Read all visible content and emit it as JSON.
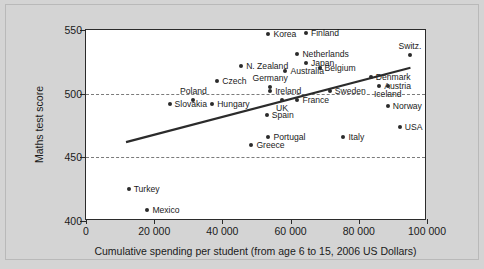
{
  "chart_data": {
    "type": "scatter",
    "title": "",
    "xlabel": "Cumulative spending per student (from age 6 to 15, 2006 US Dollars)",
    "ylabel": "Maths test score",
    "xlim": [
      0,
      100000
    ],
    "ylim": [
      400,
      550
    ],
    "xticks": [
      0,
      20000,
      40000,
      60000,
      80000,
      100000
    ],
    "xtick_labels": [
      "0",
      "20 000",
      "40 000",
      "60 000",
      "80 000",
      "100 000"
    ],
    "yticks": [
      400,
      450,
      500,
      550
    ],
    "ytick_labels": [
      "400",
      "450",
      "500",
      "550"
    ],
    "gridlines_y": [
      450,
      500
    ],
    "grid": "dashed horizontal gridlines at 450 and 500",
    "legend": "none",
    "points": [
      {
        "label": "Korea",
        "x": 53500,
        "y": 547,
        "pos": "right"
      },
      {
        "label": "Finland",
        "x": 64500,
        "y": 548,
        "pos": "right"
      },
      {
        "label": "Switz.",
        "x": 95000,
        "y": 530,
        "pos": "above"
      },
      {
        "label": "Netherlands",
        "x": 62000,
        "y": 531,
        "pos": "right"
      },
      {
        "label": "Japan",
        "x": 64500,
        "y": 524,
        "pos": "right"
      },
      {
        "label": "Belgium",
        "x": 68500,
        "y": 520,
        "pos": "right"
      },
      {
        "label": "Australia",
        "x": 58500,
        "y": 518,
        "pos": "right"
      },
      {
        "label": "N. Zealand",
        "x": 45500,
        "y": 522,
        "pos": "right"
      },
      {
        "label": "Czech",
        "x": 38500,
        "y": 510,
        "pos": "right"
      },
      {
        "label": "Denmark",
        "x": 83500,
        "y": 513,
        "pos": "right"
      },
      {
        "label": "Germany",
        "x": 54000,
        "y": 505,
        "pos": "above"
      },
      {
        "label": "Austria",
        "x": 86000,
        "y": 506,
        "pos": "right"
      },
      {
        "label": "Ireland",
        "x": 54000,
        "y": 502,
        "pos": "right"
      },
      {
        "label": "Sweden",
        "x": 71500,
        "y": 502,
        "pos": "right"
      },
      {
        "label": "Iceland",
        "x": 88500,
        "y": 506,
        "pos": "below"
      },
      {
        "label": "UK",
        "x": 57500,
        "y": 495,
        "pos": "below"
      },
      {
        "label": "France",
        "x": 62000,
        "y": 495,
        "pos": "right"
      },
      {
        "label": "Poland",
        "x": 31500,
        "y": 495,
        "pos": "above"
      },
      {
        "label": "Slovakia",
        "x": 24500,
        "y": 492,
        "pos": "right"
      },
      {
        "label": "Hungary",
        "x": 37000,
        "y": 492,
        "pos": "right"
      },
      {
        "label": "Spain",
        "x": 53000,
        "y": 483,
        "pos": "right"
      },
      {
        "label": "Norway",
        "x": 88500,
        "y": 490,
        "pos": "right"
      },
      {
        "label": "USA",
        "x": 92000,
        "y": 474,
        "pos": "right"
      },
      {
        "label": "Portugal",
        "x": 53500,
        "y": 466,
        "pos": "right"
      },
      {
        "label": "Italy",
        "x": 75500,
        "y": 466,
        "pos": "right"
      },
      {
        "label": "Greece",
        "x": 48500,
        "y": 460,
        "pos": "right"
      },
      {
        "label": "Turkey",
        "x": 12500,
        "y": 425,
        "pos": "right"
      },
      {
        "label": "Mexico",
        "x": 18000,
        "y": 409,
        "pos": "right"
      }
    ],
    "trendline": {
      "description": "linear best-fit line rising left to right",
      "x0": 11800,
      "y0": 461,
      "x1": 95700,
      "y1": 520,
      "color": "#2b2b2b"
    },
    "colors": {
      "background": "#d4d4d4",
      "plot_background": "#ffffff",
      "marker": "#2b2b2b",
      "axis": "#2b2b2b",
      "gridline": "#7b7b7b"
    }
  }
}
